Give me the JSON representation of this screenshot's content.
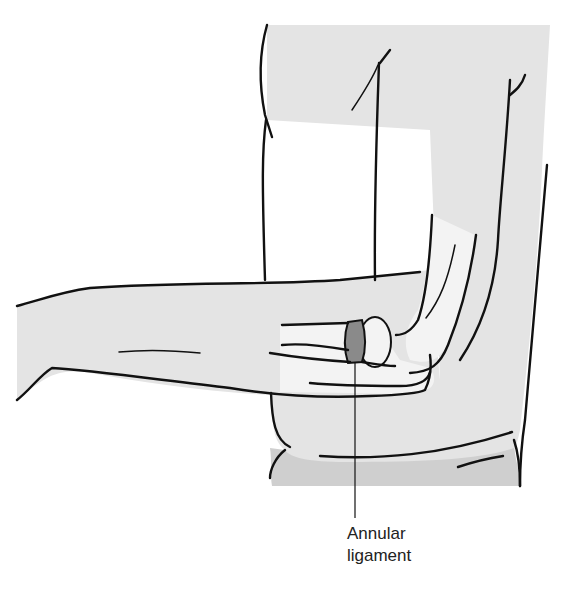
{
  "figure": {
    "callout": {
      "line1": "Annular",
      "line2": "ligament"
    },
    "colors": {
      "skin_fill": "#e4e4e4",
      "bone_fill": "#f3f3f3",
      "ligament_fill": "#8a8a8a",
      "clothing_fill": "#cfcfcf",
      "outline": "#111111"
    }
  }
}
